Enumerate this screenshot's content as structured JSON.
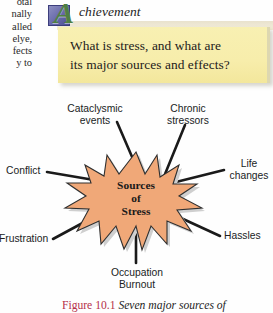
{
  "left_column": {
    "lines": [
      "otal",
      "nally",
      "alled",
      "elye,",
      "fects",
      "y  to"
    ]
  },
  "achievement": {
    "letter": "A",
    "word": "chievement",
    "icon": "square-badge-icon",
    "bar_color": "#efe9d6",
    "letter_color": "#4f7f43",
    "square_color": "#5d5fa2"
  },
  "question_box": {
    "line1": "What is stress, and what are",
    "line2": "its major sources and effects?",
    "background": "#f7edab"
  },
  "diagram": {
    "center": {
      "line1": "Sources",
      "line2": "of",
      "line3": "Stress"
    },
    "burst_fill": "#f0a878",
    "burst_stroke": "#3a3a3a",
    "burst_shadow": "#c9c9c9",
    "labels": [
      {
        "id": "cataclysmic-events",
        "line1": "Cataclysmic",
        "line2": "events"
      },
      {
        "id": "chronic-stressors",
        "line1": "Chronic",
        "line2": "stressors"
      },
      {
        "id": "conflict",
        "line1": "Conflict",
        "line2": ""
      },
      {
        "id": "life-changes",
        "line1": "Life",
        "line2": "changes"
      },
      {
        "id": "frustration",
        "line1": "Frustration",
        "line2": ""
      },
      {
        "id": "hassles",
        "line1": "Hassles",
        "line2": ""
      },
      {
        "id": "occupation-burnout",
        "line1": "Occupation",
        "line2": "Burnout"
      }
    ]
  },
  "caption": {
    "number": "Figure 10.1",
    "text": "Seven major sources of"
  }
}
